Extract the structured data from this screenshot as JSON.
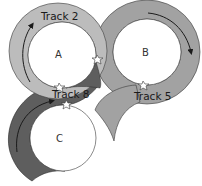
{
  "colors": {
    "track_a": "#bcbcbc",
    "track_b": "#a2a2a2",
    "track_c": "#5e5e5e",
    "outline": "#3a3a3a",
    "interior": "#ffffff"
  },
  "tracks": [
    {
      "id": "track-2",
      "label": "Track 2",
      "ring": "A",
      "direction": "clockwise"
    },
    {
      "id": "track-5",
      "label": "Track 5",
      "ring": "B",
      "direction": "clockwise"
    },
    {
      "id": "track-8",
      "label": "Track 8",
      "ring": "C",
      "direction": "clockwise"
    }
  ],
  "zones": [
    {
      "id": "zone-a",
      "label": "A"
    },
    {
      "id": "zone-b",
      "label": "B"
    },
    {
      "id": "zone-c",
      "label": "C"
    }
  ],
  "junctions": [
    {
      "id": "junction-a-b",
      "icon": "star-junction-icon"
    },
    {
      "id": "junction-a-c",
      "icon": "star-junction-icon"
    },
    {
      "id": "junction-b-spur",
      "icon": "star-junction-icon"
    },
    {
      "id": "junction-c-top",
      "icon": "star-junction-icon"
    }
  ]
}
